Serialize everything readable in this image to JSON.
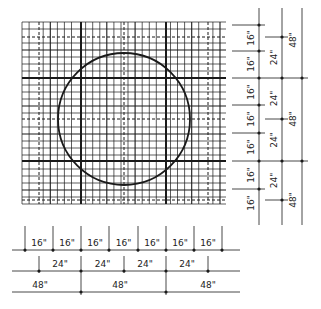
{
  "diagram": {
    "colors": {
      "line": "#1a1a1a",
      "grid": "#2a2a2a",
      "background": "#ffffff"
    }
  },
  "grid": {
    "x0": 22,
    "x1": 226,
    "y0": 22,
    "y1": 204,
    "fine_step_x": 7.07,
    "fine_step_y": 7.0,
    "thick_x": [
      81,
      166
    ],
    "thick_y": [
      78,
      161
    ],
    "medium_x": [
      53,
      109,
      138,
      194,
      222
    ],
    "medium_y": [
      51,
      105,
      133,
      189
    ],
    "dashed_x": [
      39,
      124,
      208
    ],
    "dashed_y": [
      37,
      119,
      200
    ]
  },
  "circle": {
    "cx": 124,
    "cy": 119,
    "r": 66
  },
  "dimensions": {
    "bottom": {
      "row16": {
        "y": 250,
        "ticks": [
          25,
          53,
          81,
          109,
          138,
          166,
          194,
          222
        ],
        "labels": [
          "16\"",
          "16\"",
          "16\"",
          "16\"",
          "16\"",
          "16\"",
          "16\""
        ]
      },
      "row24": {
        "y": 271,
        "ticks": [
          39,
          81,
          124,
          166,
          208
        ],
        "labels": [
          "24\"",
          "24\"",
          "24\"",
          "24\""
        ]
      },
      "row48": {
        "y": 292,
        "ticks": [
          81,
          166
        ],
        "labels": [
          "48\"",
          "48\"",
          "48\""
        ],
        "label_x": [
          40,
          120,
          208
        ]
      }
    },
    "right": {
      "col16": {
        "x": 259,
        "ticks": [
          25,
          51,
          78,
          105,
          133,
          161,
          189
        ],
        "labels": [
          "16\"",
          "16\"",
          "16\"",
          "16\"",
          "16\"",
          "16\"",
          "16\""
        ],
        "label_y": [
          38,
          64,
          92,
          119,
          147,
          175,
          203
        ]
      },
      "col24": {
        "x": 282,
        "ticks": [
          37,
          78,
          119,
          161,
          200
        ],
        "labels": [
          "24\"",
          "24\"",
          "24\"",
          "24\""
        ]
      },
      "col48": {
        "x": 302,
        "ticks": [
          78,
          161
        ],
        "labels": [
          "48\"",
          "48\"",
          "48\""
        ],
        "label_y": [
          40,
          119,
          200
        ]
      }
    }
  }
}
